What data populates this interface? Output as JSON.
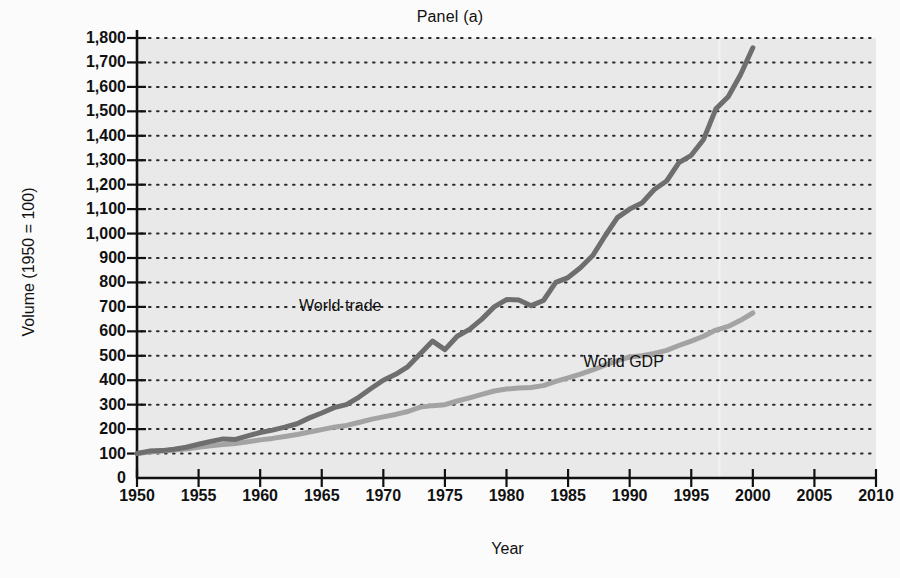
{
  "chart_data": {
    "type": "line",
    "title": "Panel (a)",
    "xlabel": "Year",
    "ylabel": "Volume (1950 = 100)",
    "xlim": [
      1950,
      2010
    ],
    "ylim": [
      0,
      1800
    ],
    "xticks": [
      "1950",
      "1955",
      "1960",
      "1965",
      "1970",
      "1975",
      "1980",
      "1985",
      "1990",
      "1995",
      "2000",
      "2005",
      "2010"
    ],
    "xtick_values": [
      1950,
      1955,
      1960,
      1965,
      1970,
      1975,
      1980,
      1985,
      1990,
      1995,
      2000,
      2005,
      2010
    ],
    "yticks": [
      "0",
      "100",
      "200",
      "300",
      "400",
      "500",
      "600",
      "700",
      "800",
      "900",
      "1,000",
      "1,100",
      "1,200",
      "1,300",
      "1,400",
      "1,500",
      "1,600",
      "1,700",
      "1,800"
    ],
    "ytick_values": [
      0,
      100,
      200,
      300,
      400,
      500,
      600,
      700,
      800,
      900,
      1000,
      1100,
      1200,
      1300,
      1400,
      1500,
      1600,
      1700,
      1800
    ],
    "grid": "horizontal-dotted",
    "legend_position": "inline-annotations",
    "plot_background": "#e9e9e9",
    "series": [
      {
        "name": "World trade",
        "color": "#6e6e6e",
        "label_x": 1966.5,
        "label_y": 700,
        "x": [
          1950,
          1951,
          1952,
          1953,
          1954,
          1955,
          1956,
          1957,
          1958,
          1959,
          1960,
          1961,
          1962,
          1963,
          1964,
          1965,
          1966,
          1967,
          1968,
          1969,
          1970,
          1971,
          1972,
          1973,
          1974,
          1975,
          1976,
          1977,
          1978,
          1979,
          1980,
          1981,
          1982,
          1983,
          1984,
          1985,
          1986,
          1987,
          1988,
          1989,
          1990,
          1991,
          1992,
          1993,
          1994,
          1995,
          1996,
          1997,
          1998,
          1999,
          2000
        ],
        "y": [
          100,
          110,
          112,
          118,
          126,
          138,
          150,
          160,
          158,
          172,
          186,
          196,
          208,
          222,
          246,
          266,
          288,
          300,
          330,
          366,
          400,
          424,
          456,
          508,
          560,
          525,
          580,
          608,
          650,
          700,
          730,
          728,
          705,
          726,
          800,
          820,
          860,
          910,
          990,
          1065,
          1100,
          1125,
          1180,
          1215,
          1290,
          1320,
          1385,
          1510,
          1560,
          1650,
          1760
        ]
      },
      {
        "name": "World GDP",
        "color": "#a3a3a3",
        "label_x": 1989.5,
        "label_y": 470,
        "x": [
          1950,
          1951,
          1952,
          1953,
          1954,
          1955,
          1956,
          1957,
          1958,
          1959,
          1960,
          1961,
          1962,
          1963,
          1964,
          1965,
          1966,
          1967,
          1968,
          1969,
          1970,
          1971,
          1972,
          1973,
          1974,
          1975,
          1976,
          1977,
          1978,
          1979,
          1980,
          1981,
          1982,
          1983,
          1984,
          1985,
          1986,
          1987,
          1988,
          1989,
          1990,
          1991,
          1992,
          1993,
          1994,
          1995,
          1996,
          1997,
          1998,
          1999,
          2000
        ],
        "y": [
          100,
          106,
          110,
          115,
          119,
          126,
          132,
          137,
          141,
          148,
          156,
          162,
          170,
          178,
          188,
          198,
          208,
          215,
          227,
          240,
          250,
          260,
          272,
          290,
          296,
          300,
          315,
          328,
          342,
          356,
          364,
          368,
          370,
          378,
          395,
          410,
          425,
          442,
          462,
          480,
          495,
          500,
          510,
          522,
          542,
          560,
          580,
          605,
          620,
          645,
          675
        ]
      }
    ]
  }
}
